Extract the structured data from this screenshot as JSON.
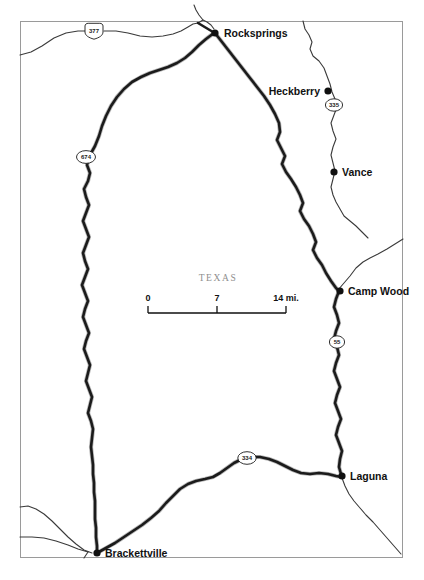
{
  "map": {
    "title": "Texas regional road map",
    "state_label": "TEXAS",
    "background_color": "#ffffff",
    "frame_color": "#9a9a9a",
    "road_color": "#1b1b1b",
    "minor_road_color": "#3a3a3a",
    "label_color": "#111111",
    "state_label_color": "#8e8e8e",
    "cities": [
      {
        "name": "Rocksprings",
        "dot_x": 215,
        "dot_y": 33,
        "label_x": 224,
        "label_y": 37,
        "anchor": "start"
      },
      {
        "name": "Heckberry",
        "dot_x": 328,
        "dot_y": 91,
        "label_x": 320,
        "label_y": 95,
        "anchor": "end"
      },
      {
        "name": "Vance",
        "dot_x": 334,
        "dot_y": 172,
        "label_x": 342,
        "label_y": 176,
        "anchor": "start"
      },
      {
        "name": "Camp Wood",
        "dot_x": 340,
        "dot_y": 291,
        "label_x": 348,
        "label_y": 295,
        "anchor": "start"
      },
      {
        "name": "Laguna",
        "dot_x": 342,
        "dot_y": 476,
        "label_x": 350,
        "label_y": 480,
        "anchor": "start"
      },
      {
        "name": "Brackettville",
        "dot_x": 97,
        "dot_y": 553,
        "label_x": 105,
        "label_y": 557,
        "anchor": "start"
      }
    ],
    "route_shields": [
      {
        "number": "377",
        "x": 94,
        "y": 32,
        "shape": "us-shield"
      },
      {
        "number": "674",
        "x": 86,
        "y": 157,
        "shape": "oval"
      },
      {
        "number": "335",
        "x": 334,
        "y": 105,
        "shape": "oval"
      },
      {
        "number": "55",
        "x": 337,
        "y": 342,
        "shape": "oval"
      },
      {
        "number": "334",
        "x": 247,
        "y": 458,
        "shape": "oval"
      }
    ],
    "scale_bar": {
      "labels": [
        "0",
        "7",
        "14 mi."
      ],
      "x_start": 148,
      "x_mid": 217,
      "x_end": 286,
      "y_line": 313,
      "y_text": 303,
      "unit": "mi."
    },
    "state_label_pos": {
      "x": 218,
      "y": 281
    },
    "frame": {
      "x": 20,
      "y": 21,
      "width": 383,
      "height": 537
    }
  }
}
